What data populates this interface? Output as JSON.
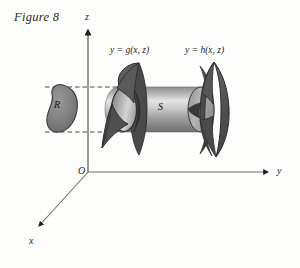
{
  "figure": {
    "caption": "Figure 8",
    "background_color": "#fdfdfc",
    "ink_color": "#1d1d1d"
  },
  "axes": {
    "z_label": "z",
    "y_label": "y",
    "x_label": "x",
    "origin_label": "O",
    "axis_color": "#6e6e6e",
    "z_axis": {
      "x1": 88,
      "y1": 172,
      "x2": 88,
      "y2": 26
    },
    "y_axis": {
      "x1": 88,
      "y1": 172,
      "x2": 272,
      "y2": 172
    },
    "x_axis": {
      "x1": 88,
      "y1": 172,
      "x2": 36,
      "y2": 229
    }
  },
  "region": {
    "label": "R",
    "fill_color": "#7c7c7c",
    "stroke_color": "#3a3a3a",
    "center_x": 62,
    "center_y": 109,
    "guide_line_top_y": 87,
    "guide_line_bottom_y": 132,
    "guide_line_x_start": 44,
    "guide_line_x_end": 108,
    "guide_color": "#4a4a4a"
  },
  "solid": {
    "label": "S",
    "cylinder_fill_light": "#e2e2e2",
    "cylinder_fill_mid": "#9d9d9d",
    "cylinder_fill_dark": "#6b6b6b",
    "cylinder_left_x": 112,
    "cylinder_right_x": 207,
    "cylinder_top_y": 87,
    "cylinder_bottom_y": 132,
    "cap_rx": 13,
    "cap_ry": 23
  },
  "surfaces": {
    "left": {
      "equation": "y = g(x, z)",
      "fill_color": "#555555",
      "stroke_color": "#2f2f2f"
    },
    "right": {
      "equation": "y = h(x, z)",
      "fill_color": "#555555",
      "stroke_color": "#2f2f2f"
    }
  }
}
